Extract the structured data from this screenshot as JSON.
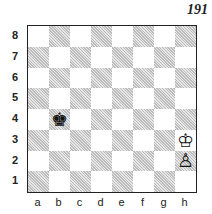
{
  "puzzle_number": "191",
  "ranks": [
    "8",
    "7",
    "6",
    "5",
    "4",
    "3",
    "2",
    "1"
  ],
  "files": [
    "a",
    "b",
    "c",
    "d",
    "e",
    "f",
    "g",
    "h"
  ],
  "pieces": [
    {
      "square": "b4",
      "glyph": "♚",
      "name": "black-king"
    },
    {
      "square": "h3",
      "glyph": "♔",
      "name": "white-king"
    },
    {
      "square": "h2",
      "glyph": "♙",
      "name": "white-pawn"
    }
  ]
}
